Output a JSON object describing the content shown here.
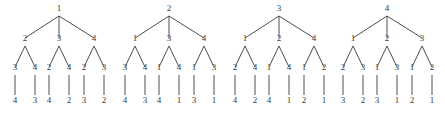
{
  "figure": {
    "kind": "forest-of-labeled-trees",
    "background_color": "#ffffff",
    "ink_color": "#3a3a3a",
    "tree_count": 4,
    "levels": 4
  },
  "trees": [
    {
      "name": "tree-1",
      "root": "1",
      "level2": [
        "2",
        "3",
        "4"
      ],
      "level3": [
        [
          "3",
          "4"
        ],
        [
          "2",
          "4"
        ],
        [
          "2",
          "3"
        ]
      ],
      "level4": [
        [
          "4",
          "3"
        ],
        [
          "4",
          "2"
        ],
        [
          "3",
          "2"
        ]
      ]
    },
    {
      "name": "tree-2",
      "root": "2",
      "level2": [
        "1",
        "3",
        "4"
      ],
      "level3": [
        [
          "3",
          "4"
        ],
        [
          "1",
          "4"
        ],
        [
          "1",
          "3"
        ]
      ],
      "level4": [
        [
          "4",
          "3"
        ],
        [
          "4",
          "1"
        ],
        [
          "3",
          "1"
        ]
      ]
    },
    {
      "name": "tree-3",
      "root": "3",
      "level2": [
        "1",
        "2",
        "4"
      ],
      "level3": [
        [
          "2",
          "4"
        ],
        [
          "1",
          "4"
        ],
        [
          "1",
          "2"
        ]
      ],
      "level4": [
        [
          "4",
          "2"
        ],
        [
          "4",
          "1"
        ],
        [
          "2",
          "1"
        ]
      ]
    },
    {
      "name": "tree-4",
      "root": "4",
      "level2": [
        "1",
        "2",
        "3"
      ],
      "level3": [
        [
          "2",
          "3"
        ],
        [
          "1",
          "3"
        ],
        [
          "1",
          "2"
        ]
      ],
      "level4": [
        [
          "3",
          "2"
        ],
        [
          "3",
          "1"
        ],
        [
          "2",
          "1"
        ]
      ]
    }
  ],
  "geometry": {
    "tree_origins_x": [
      8,
      118,
      228,
      336
    ],
    "tree_width": 102,
    "row_y": [
      12,
      42,
      71,
      104
    ],
    "root_x": 51,
    "level2_x": [
      17,
      51,
      86
    ],
    "level3_offsets": [
      -10,
      10
    ],
    "label_gap_top": 4,
    "label_gap_bottom": 9
  }
}
